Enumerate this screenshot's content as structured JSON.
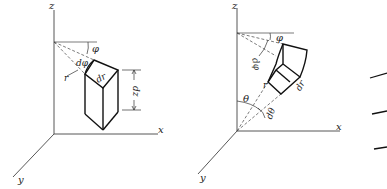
{
  "figure": {
    "panels": [
      {
        "id": "cylindrical",
        "axes": {
          "x": "x",
          "y": "y",
          "z": "z"
        },
        "labels": {
          "phi": "φ",
          "dphi": "dφ",
          "r": "r",
          "dr": "dr",
          "dz": "dz"
        }
      },
      {
        "id": "spherical",
        "axes": {
          "x": "x",
          "y": "y",
          "z": "z"
        },
        "labels": {
          "phi": "φ",
          "dphi": "dφ",
          "r": "r",
          "dr": "dr",
          "theta": "θ",
          "dtheta": "dθ"
        }
      }
    ],
    "line_color": "#222222",
    "background": "#ffffff"
  }
}
